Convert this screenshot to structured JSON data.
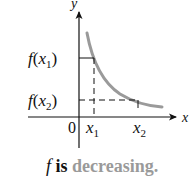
{
  "diagram": {
    "axes": {
      "y_label": "y",
      "x_label": "x",
      "origin_label": "0"
    },
    "y_ticks": [
      {
        "label_f": "f",
        "label_paren_open": "(",
        "label_var": "x",
        "label_sub": "1",
        "label_paren_close": ")"
      },
      {
        "label_f": "f",
        "label_paren_open": "(",
        "label_var": "x",
        "label_sub": "2",
        "label_paren_close": ")"
      }
    ],
    "x_ticks": [
      {
        "label_var": "x",
        "label_sub": "1"
      },
      {
        "label_var": "x",
        "label_sub": "2"
      }
    ],
    "caption": {
      "f": "f",
      "is": " is ",
      "highlight": "decreasing."
    },
    "colors": {
      "axis": "#111111",
      "curve": "#9a9a9a",
      "caption_highlight": "#9a9a9a",
      "text": "#111111"
    }
  }
}
